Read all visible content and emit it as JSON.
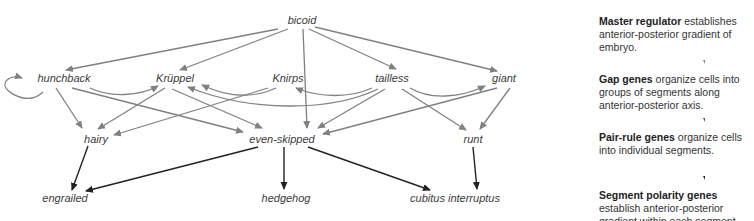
{
  "nodes": {
    "bicoid": "bicoid",
    "hunchback": "hunchback",
    "kruppel": "Krüppel",
    "knirps": "Knirps",
    "tailless": "tailless",
    "giant": "giant",
    "hairy": "hairy",
    "even_skipped": "even-skipped",
    "runt": "runt",
    "engrailed": "engrailed",
    "hedgehog": "hedgehog",
    "cubitus_interruptus": "cubitus interruptus"
  },
  "edges": [
    {
      "from": "bicoid",
      "to": "hunchback",
      "color": "gray"
    },
    {
      "from": "bicoid",
      "to": "Krüppel",
      "color": "gray"
    },
    {
      "from": "bicoid",
      "to": "tailless",
      "color": "gray"
    },
    {
      "from": "bicoid",
      "to": "giant",
      "color": "gray"
    },
    {
      "from": "bicoid",
      "to": "even-skipped",
      "color": "gray"
    },
    {
      "from": "hunchback",
      "to": "hunchback",
      "color": "gray"
    },
    {
      "from": "hunchback",
      "to": "Krüppel",
      "color": "gray"
    },
    {
      "from": "hunchback",
      "to": "hairy",
      "color": "gray"
    },
    {
      "from": "hunchback",
      "to": "even-skipped",
      "color": "gray"
    },
    {
      "from": "Krüppel",
      "to": "hairy",
      "color": "gray"
    },
    {
      "from": "Krüppel",
      "to": "even-skipped",
      "color": "gray"
    },
    {
      "from": "Knirps",
      "to": "Krüppel",
      "color": "gray"
    },
    {
      "from": "Knirps",
      "to": "hairy",
      "color": "gray"
    },
    {
      "from": "tailless",
      "to": "Knirps",
      "color": "gray"
    },
    {
      "from": "tailless",
      "to": "Krüppel",
      "color": "gray"
    },
    {
      "from": "tailless",
      "to": "giant",
      "color": "gray"
    },
    {
      "from": "tailless",
      "to": "even-skipped",
      "color": "gray"
    },
    {
      "from": "tailless",
      "to": "runt",
      "color": "gray"
    },
    {
      "from": "giant",
      "to": "even-skipped",
      "color": "gray"
    },
    {
      "from": "giant",
      "to": "runt",
      "color": "gray"
    },
    {
      "from": "hairy",
      "to": "engrailed",
      "color": "black"
    },
    {
      "from": "even-skipped",
      "to": "engrailed",
      "color": "black"
    },
    {
      "from": "even-skipped",
      "to": "hedgehog",
      "color": "black"
    },
    {
      "from": "even-skipped",
      "to": "cubitus interruptus",
      "color": "black"
    },
    {
      "from": "runt",
      "to": "cubitus interruptus",
      "color": "black"
    }
  ],
  "colors": {
    "regulatory_edge": "#808080",
    "target_edge": "#222222",
    "text": "#333333"
  },
  "panel": {
    "steps": [
      {
        "bold": "Master regulator",
        "text": " establishes anterior-posterior gradient of embryo."
      },
      {
        "bold": "Gap genes",
        "text": " organize cells into groups of segments along anterior-posterior axis."
      },
      {
        "bold": "Pair-rule genes",
        "text": " organize cells into individual segments."
      },
      {
        "bold": "Segment polarity genes",
        "text": " establish anterior-posterior gradient within each segment."
      }
    ]
  }
}
